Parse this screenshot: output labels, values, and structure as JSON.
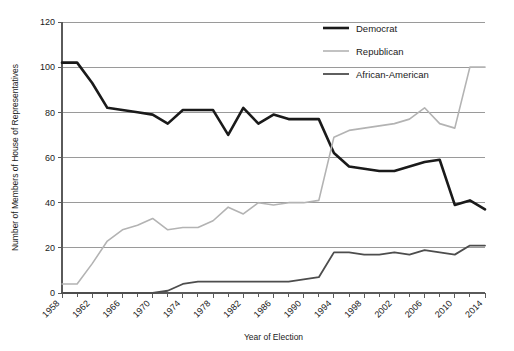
{
  "chart_data": {
    "type": "line",
    "title": "",
    "xlabel": "Year of Election",
    "ylabel": "Number of Members of House of Representatives",
    "ylim": [
      0,
      120
    ],
    "xlim": [
      1958,
      2014
    ],
    "ytick_step": 20,
    "xtick_labels": [
      "1958",
      "1962",
      "1966",
      "1970",
      "1974",
      "1978",
      "1982",
      "1986",
      "1990",
      "1994",
      "1998",
      "2002",
      "2006",
      "2010",
      "2014"
    ],
    "ytick_labels": [
      "0",
      "20",
      "40",
      "60",
      "80",
      "100",
      "120"
    ],
    "grid": "horizontal",
    "legend_position": "top-right",
    "x": [
      1958,
      1960,
      1962,
      1964,
      1966,
      1968,
      1970,
      1972,
      1974,
      1976,
      1978,
      1980,
      1982,
      1984,
      1986,
      1988,
      1990,
      1992,
      1994,
      1996,
      1998,
      2000,
      2002,
      2004,
      2006,
      2008,
      2010,
      2012,
      2014
    ],
    "series": [
      {
        "name": "Democrat",
        "color": "#1a1a1a",
        "width": 2.6,
        "values": [
          102,
          102,
          93,
          82,
          81,
          80,
          79,
          75,
          81,
          81,
          81,
          70,
          82,
          75,
          79,
          77,
          77,
          77,
          62,
          56,
          55,
          54,
          54,
          56,
          58,
          59,
          39,
          41,
          37
        ]
      },
      {
        "name": "Republican",
        "color": "#b3b3b3",
        "width": 1.6,
        "values": [
          4,
          4,
          13,
          23,
          28,
          30,
          33,
          28,
          29,
          29,
          32,
          38,
          35,
          40,
          39,
          40,
          40,
          41,
          69,
          72,
          73,
          74,
          75,
          77,
          82,
          75,
          73,
          100,
          100
        ]
      },
      {
        "name": "African-American",
        "color": "#4d4d4d",
        "width": 1.8,
        "values": [
          0,
          0,
          0,
          0,
          0,
          0,
          0,
          1,
          4,
          5,
          5,
          5,
          5,
          5,
          5,
          5,
          6,
          7,
          18,
          18,
          17,
          17,
          18,
          17,
          19,
          18,
          17,
          21,
          21
        ]
      }
    ]
  },
  "legend": {
    "items": [
      {
        "label": "Democrat"
      },
      {
        "label": "Republican"
      },
      {
        "label": "African-American"
      }
    ]
  }
}
